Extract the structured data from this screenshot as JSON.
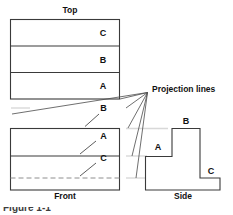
{
  "figure": {
    "caption_partial": "Figure 1-1",
    "line_color": "#3a3a3a",
    "hidden_line_color": "#8e8e8e",
    "guide_color": "#d8d8d8",
    "background": "#ffffff"
  },
  "views": {
    "top": {
      "name": "Top",
      "label": "Top",
      "bands": [
        {
          "label": "C",
          "order": 1
        },
        {
          "label": "B",
          "order": 2
        },
        {
          "label": "A",
          "order": 3
        }
      ]
    },
    "front": {
      "name": "Front",
      "label": "Front",
      "features": [
        {
          "label": "B",
          "kind": "top-edge",
          "line_style": "solid"
        },
        {
          "label": "A",
          "kind": "visible-edge",
          "line_style": "solid"
        },
        {
          "label": "C",
          "kind": "hidden-edge",
          "line_style": "dashed"
        }
      ]
    },
    "side": {
      "name": "Side",
      "label": "Side",
      "steps": [
        {
          "label": "A",
          "description": "lower left step"
        },
        {
          "label": "B",
          "description": "tall center riser"
        },
        {
          "label": "C",
          "description": "right ledge"
        }
      ]
    }
  },
  "annotations": {
    "projection_lines_label": "Projection lines",
    "projection_line_count": 6
  },
  "icons": {
    "leader": "leader-line-icon",
    "projection_fan": "projection-fan-icon"
  }
}
